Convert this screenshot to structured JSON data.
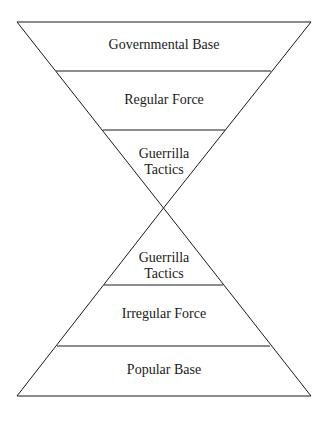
{
  "diagram": {
    "top_triangle": {
      "layers": [
        {
          "label": "Governmental Base"
        },
        {
          "label": "Regular Force"
        },
        {
          "label_line1": "Guerrilla",
          "label_line2": "Tactics"
        }
      ]
    },
    "bottom_triangle": {
      "layers": [
        {
          "label_line1": "Guerrilla",
          "label_line2": "Tactics"
        },
        {
          "label": "Irregular Force"
        },
        {
          "label": "Popular Base"
        }
      ]
    },
    "line_color": "#1a1a1a"
  }
}
